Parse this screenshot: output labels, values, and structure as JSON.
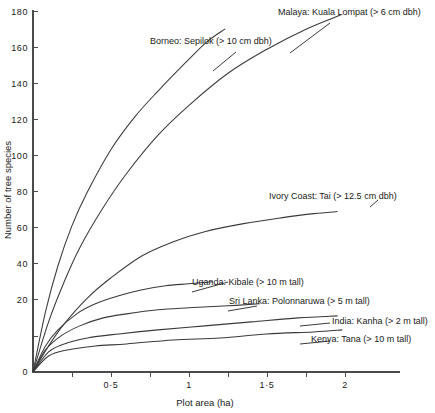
{
  "chart_data": {
    "type": "line",
    "title": "",
    "xlabel": "Plot area (ha)",
    "ylabel": "Number of tree species",
    "xlim": [
      0,
      2.2
    ],
    "ylim": [
      0,
      180
    ],
    "xticks": [
      "0·5",
      "1",
      "1·5",
      "2"
    ],
    "xtick_values": [
      0.5,
      1,
      1.5,
      2
    ],
    "yticks": [
      "0",
      "20",
      "40",
      "60",
      "80",
      "100",
      "120",
      "140",
      "160",
      "180"
    ],
    "ytick_values": [
      0,
      20,
      40,
      60,
      80,
      100,
      120,
      140,
      160,
      180
    ],
    "grid": false,
    "legend": "inline-annotations",
    "series": [
      {
        "name": "Malaya: Kuala Lompat (> 6 cm dbh)",
        "label": "Malaya: Kuala Lompat (> 6 cm dbh)",
        "x": [
          0,
          0.1,
          0.2,
          0.3,
          0.45,
          0.6,
          0.8,
          1.0,
          1.25,
          1.5,
          1.75,
          1.97
        ],
        "y": [
          0,
          25,
          45,
          62,
          82,
          99,
          118,
          133,
          149,
          161,
          171,
          178
        ]
      },
      {
        "name": "Borneo: Sepilok (> 10 cm dbh)",
        "label": "Borneo: Sepilok (> 10 cm dbh)",
        "x": [
          0,
          0.08,
          0.16,
          0.25,
          0.35,
          0.5,
          0.65,
          0.8,
          1.0,
          1.12,
          1.23
        ],
        "y": [
          0,
          30,
          53,
          73,
          90,
          111,
          127,
          140,
          156,
          165,
          171
        ]
      },
      {
        "name": "Ivory Coast: Tai (> 12.5 cm dbh)",
        "label": "Ivory Coast: Tai (> 12.5 cm dbh)",
        "x": [
          0,
          0.1,
          0.2,
          0.35,
          0.5,
          0.7,
          0.9,
          1.1,
          1.35,
          1.6,
          1.8,
          1.95
        ],
        "y": [
          0,
          13,
          24,
          37,
          47,
          58,
          65,
          70,
          74,
          77,
          79,
          80
        ]
      },
      {
        "name": "Uganda: Kibale (> 10 m tall)",
        "label": "Uganda: Kibale (> 10 m tall)",
        "x": [
          0,
          0.08,
          0.16,
          0.28,
          0.4,
          0.55,
          0.7,
          0.85,
          1.0,
          1.15
        ],
        "y": [
          0,
          13,
          21,
          29,
          34,
          38,
          41,
          43,
          44,
          45
        ]
      },
      {
        "name": "Sri Lanka: Polonnaruwa (> 5 m tall)",
        "label": "Sri Lanka: Polonnaruwa (> 5 m tall)",
        "x": [
          0,
          0.08,
          0.18,
          0.3,
          0.45,
          0.6,
          0.8,
          1.0,
          1.25,
          1.45
        ],
        "y": [
          0,
          11,
          18,
          23,
          27,
          29,
          31,
          32,
          33,
          34
        ]
      },
      {
        "name": "India: Kanha (> 2 m tall)",
        "label": "India: Kanha (> 2 m tall)",
        "x": [
          0,
          0.1,
          0.2,
          0.35,
          0.55,
          0.8,
          1.1,
          1.4,
          1.7,
          1.95
        ],
        "y": [
          0,
          10,
          14,
          17,
          19,
          21,
          23,
          25,
          27,
          28
        ]
      },
      {
        "name": "Kenya: Tana (> 10 m tall)",
        "label": "Kenya: Tana (> 10 m tall)",
        "x": [
          0,
          0.1,
          0.22,
          0.4,
          0.6,
          0.9,
          1.2,
          1.5,
          1.8,
          1.98
        ],
        "y": [
          0,
          8,
          11,
          13,
          14,
          16,
          17,
          19,
          20,
          21
        ]
      }
    ]
  },
  "axes": {
    "y_title": "Number of tree species",
    "x_title": "Plot area (ha)"
  },
  "ytick_labels": {
    "t180": "180",
    "t160": "160",
    "t140": "140",
    "t120": "120",
    "t100": "100",
    "t80": "80",
    "t60": "60",
    "t40": "40",
    "t20": "20",
    "t0": "0"
  },
  "xtick_labels": {
    "t05": "0·5",
    "t1": "1",
    "t15": "1·5",
    "t2": "2"
  },
  "annotations": {
    "malaya": "Malaya: Kuala Lompat (> 6 cm dbh)",
    "borneo": "Borneo: Sepilok (> 10 cm dbh)",
    "ivory": "Ivory Coast: Tai (> 12.5 cm dbh)",
    "uganda": "Uganda: Kibale (> 10 m tall)",
    "srilanka": "Sri Lanka: Polonnaruwa (> 5 m tall)",
    "india": "India: Kanha (> 2 m tall)",
    "kenya": "Kenya: Tana (> 10 m tall)"
  },
  "colors": {
    "curve": "#3a3a3a",
    "axis": "#4a4a4a",
    "text": "#1a1a1a",
    "background": "#ffffff"
  }
}
